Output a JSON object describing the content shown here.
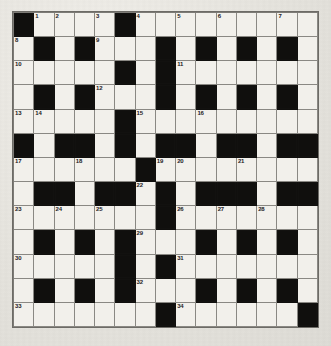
{
  "puzzle": {
    "type": "crossword-grid",
    "rows": 15,
    "cols": 15,
    "colors": {
      "block": "#100f0d",
      "open": "#f2f0eb",
      "rule": "#8a8883",
      "page": "#e8e6e1",
      "number_text": "#24221f"
    },
    "legend": {
      "0": "open-cell",
      "1": "block-cell"
    },
    "grid": [
      [
        1,
        0,
        0,
        0,
        0,
        1,
        0,
        0,
        0,
        0,
        0,
        0,
        0,
        0,
        0
      ],
      [
        0,
        1,
        0,
        1,
        0,
        0,
        0,
        1,
        0,
        1,
        0,
        1,
        0,
        1,
        0
      ],
      [
        0,
        0,
        0,
        0,
        0,
        1,
        0,
        1,
        0,
        0,
        0,
        0,
        0,
        0,
        0
      ],
      [
        0,
        1,
        0,
        1,
        0,
        0,
        0,
        1,
        0,
        1,
        0,
        1,
        0,
        1,
        0
      ],
      [
        0,
        0,
        0,
        0,
        0,
        1,
        0,
        0,
        0,
        0,
        0,
        0,
        0,
        0,
        0
      ],
      [
        1,
        0,
        1,
        1,
        0,
        1,
        0,
        1,
        1,
        0,
        1,
        1,
        0,
        1,
        1
      ],
      [
        0,
        0,
        0,
        0,
        0,
        0,
        1,
        0,
        0,
        0,
        0,
        0,
        0,
        0,
        0
      ],
      [
        0,
        1,
        1,
        0,
        1,
        1,
        0,
        1,
        0,
        1,
        1,
        1,
        0,
        1,
        1
      ],
      [
        0,
        0,
        0,
        0,
        0,
        0,
        0,
        1,
        0,
        0,
        0,
        0,
        0,
        0,
        0
      ],
      [
        0,
        1,
        0,
        1,
        0,
        1,
        0,
        0,
        0,
        1,
        0,
        1,
        0,
        1,
        0
      ],
      [
        0,
        0,
        0,
        0,
        0,
        1,
        0,
        1,
        0,
        0,
        0,
        0,
        0,
        0,
        0
      ],
      [
        0,
        1,
        0,
        1,
        0,
        1,
        0,
        0,
        0,
        1,
        0,
        1,
        0,
        1,
        0
      ],
      [
        0,
        0,
        0,
        0,
        0,
        0,
        0,
        1,
        0,
        0,
        0,
        0,
        0,
        0,
        1
      ],
      [
        1,
        1,
        1,
        1,
        1,
        1,
        1,
        1,
        1,
        1,
        1,
        1,
        1,
        1,
        1
      ],
      [
        1,
        1,
        1,
        1,
        1,
        1,
        1,
        1,
        1,
        1,
        1,
        1,
        1,
        1,
        1
      ]
    ],
    "numbers": [
      {
        "row": 0,
        "col": 1,
        "label": "1"
      },
      {
        "row": 0,
        "col": 2,
        "label": "2"
      },
      {
        "row": 0,
        "col": 4,
        "label": "3"
      },
      {
        "row": 0,
        "col": 6,
        "label": "4"
      },
      {
        "row": 0,
        "col": 8,
        "label": "5"
      },
      {
        "row": 0,
        "col": 10,
        "label": "6"
      },
      {
        "row": 0,
        "col": 13,
        "label": "7"
      },
      {
        "row": 1,
        "col": 0,
        "label": "8"
      },
      {
        "row": 1,
        "col": 4,
        "label": "9"
      },
      {
        "row": 2,
        "col": 0,
        "label": "10"
      },
      {
        "row": 2,
        "col": 8,
        "label": "11"
      },
      {
        "row": 3,
        "col": 4,
        "label": "12"
      },
      {
        "row": 4,
        "col": 0,
        "label": "13"
      },
      {
        "row": 4,
        "col": 1,
        "label": "14"
      },
      {
        "row": 4,
        "col": 6,
        "label": "15"
      },
      {
        "row": 4,
        "col": 9,
        "label": "16"
      },
      {
        "row": 6,
        "col": 0,
        "label": "17"
      },
      {
        "row": 6,
        "col": 3,
        "label": "18"
      },
      {
        "row": 6,
        "col": 7,
        "label": "19"
      },
      {
        "row": 6,
        "col": 8,
        "label": "20"
      },
      {
        "row": 6,
        "col": 11,
        "label": "21"
      },
      {
        "row": 7,
        "col": 6,
        "label": "22"
      },
      {
        "row": 8,
        "col": 0,
        "label": "23"
      },
      {
        "row": 8,
        "col": 2,
        "label": "24"
      },
      {
        "row": 8,
        "col": 4,
        "label": "25"
      },
      {
        "row": 8,
        "col": 8,
        "label": "26"
      },
      {
        "row": 8,
        "col": 10,
        "label": "27"
      },
      {
        "row": 8,
        "col": 12,
        "label": "28"
      },
      {
        "row": 9,
        "col": 6,
        "label": "29"
      },
      {
        "row": 10,
        "col": 0,
        "label": "30"
      },
      {
        "row": 10,
        "col": 8,
        "label": "31"
      },
      {
        "row": 11,
        "col": 6,
        "label": "32"
      },
      {
        "row": 12,
        "col": 0,
        "label": "33"
      },
      {
        "row": 12,
        "col": 8,
        "label": "34"
      }
    ]
  }
}
